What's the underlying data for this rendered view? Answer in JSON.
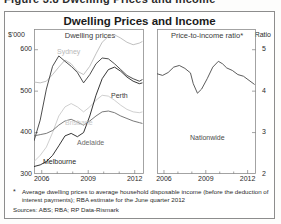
{
  "figure": {
    "cut_caption": "Figure 3.8   Dwelling Prices and Income",
    "title": "Dwelling Prices and Income"
  },
  "axes": {
    "left_unit": "$'000",
    "right_unit": "Ratio",
    "left_panel_label": "Dwelling prices",
    "right_panel_label": "Price-to-income ratio*",
    "left_yticks": [
      "600",
      "500",
      "400",
      "300"
    ],
    "right_yticks": [
      "5",
      "4",
      "3",
      "2"
    ],
    "xticks": [
      "2006",
      "2009",
      "2012"
    ]
  },
  "footnote": {
    "mark": "*",
    "text": "Average dwelling prices to average household disposable income (before the deduction of interest payments); RBA estimate for the June quarter 2012",
    "sources": "Sources: ABS; RBA; RP Data-Rismark"
  },
  "colors": {
    "sydney": "#b9b9b9",
    "perth": "#3a3a3a",
    "brisbane": "#c9c9c9",
    "adelaide": "#6a6a6a",
    "melbourne": "#1f1f1f",
    "nationwide": "#4a4a4a",
    "axis": "#8d8d8d"
  },
  "chart_data": [
    {
      "type": "line",
      "title": "Dwelling prices",
      "xlabel": "",
      "ylabel": "$'000",
      "xlim": [
        2005.5,
        2012.6
      ],
      "ylim": [
        300,
        650
      ],
      "yticks": [
        300,
        400,
        500,
        600
      ],
      "xticks": [
        2006,
        2009,
        2012
      ],
      "grid": false,
      "legend": "inline-labels",
      "series": [
        {
          "name": "Sydney",
          "color": "#b9b9b9",
          "x": [
            2005.5,
            2005.9,
            2006.3,
            2006.7,
            2007.1,
            2007.5,
            2007.9,
            2008.3,
            2008.7,
            2009.1,
            2009.5,
            2009.9,
            2010.3,
            2010.7,
            2011.1,
            2011.5,
            2011.9,
            2012.3,
            2012.5
          ],
          "values": [
            522,
            520,
            524,
            540,
            558,
            575,
            566,
            548,
            540,
            560,
            590,
            618,
            632,
            636,
            628,
            618,
            612,
            616,
            620
          ]
        },
        {
          "name": "Perth",
          "color": "#3a3a3a",
          "x": [
            2005.5,
            2005.9,
            2006.3,
            2006.7,
            2007.1,
            2007.5,
            2007.9,
            2008.3,
            2008.7,
            2009.1,
            2009.5,
            2009.9,
            2010.3,
            2010.7,
            2011.1,
            2011.5,
            2011.9,
            2012.3,
            2012.5
          ],
          "values": [
            380,
            430,
            505,
            560,
            585,
            572,
            560,
            545,
            520,
            540,
            566,
            580,
            578,
            566,
            552,
            538,
            530,
            524,
            528
          ]
        },
        {
          "name": "Brisbane",
          "color": "#c9c9c9",
          "x": [
            2005.5,
            2005.9,
            2006.3,
            2006.7,
            2007.1,
            2007.5,
            2007.9,
            2008.3,
            2008.7,
            2009.1,
            2009.5,
            2009.9,
            2010.3,
            2010.7,
            2011.1,
            2011.5,
            2011.9,
            2012.3,
            2012.5
          ],
          "values": [
            330,
            345,
            365,
            400,
            440,
            462,
            470,
            462,
            450,
            462,
            478,
            490,
            488,
            478,
            466,
            456,
            450,
            448,
            450
          ]
        },
        {
          "name": "Adelaide",
          "color": "#6a6a6a",
          "x": [
            2005.5,
            2005.9,
            2006.3,
            2006.7,
            2007.1,
            2007.5,
            2007.9,
            2008.3,
            2008.7,
            2009.1,
            2009.5,
            2009.9,
            2010.3,
            2010.7,
            2011.1,
            2011.5,
            2011.9,
            2012.3,
            2012.5
          ],
          "values": [
            392,
            395,
            398,
            405,
            418,
            428,
            432,
            425,
            418,
            428,
            440,
            450,
            452,
            448,
            440,
            434,
            428,
            424,
            422
          ]
        },
        {
          "name": "Melbourne",
          "color": "#1f1f1f",
          "x": [
            2005.5,
            2005.9,
            2006.3,
            2006.7,
            2007.1,
            2007.5,
            2007.9,
            2008.3,
            2008.7,
            2009.1,
            2009.5,
            2009.9,
            2010.3,
            2010.7,
            2011.1,
            2011.5,
            2011.9,
            2012.3,
            2012.5
          ],
          "values": [
            318,
            322,
            330,
            345,
            368,
            392,
            398,
            390,
            400,
            440,
            490,
            530,
            552,
            558,
            548,
            534,
            524,
            518,
            520
          ]
        }
      ]
    },
    {
      "type": "line",
      "title": "Price-to-income ratio*",
      "xlabel": "",
      "ylabel": "Ratio",
      "xlim": [
        2005.5,
        2012.6
      ],
      "ylim": [
        2,
        5.5
      ],
      "yticks": [
        2,
        3,
        4,
        5
      ],
      "xticks": [
        2006,
        2009,
        2012
      ],
      "grid": false,
      "series": [
        {
          "name": "Nationwide",
          "color": "#4a4a4a",
          "x": [
            2005.5,
            2005.9,
            2006.3,
            2006.7,
            2007.1,
            2007.5,
            2007.9,
            2008.1,
            2008.4,
            2008.7,
            2009.1,
            2009.5,
            2009.9,
            2010.2,
            2010.5,
            2010.9,
            2011.3,
            2011.7,
            2012.1,
            2012.5
          ],
          "values": [
            4.42,
            4.38,
            4.45,
            4.58,
            4.62,
            4.55,
            4.44,
            4.18,
            3.95,
            4.05,
            4.3,
            4.58,
            4.72,
            4.66,
            4.56,
            4.5,
            4.4,
            4.36,
            4.26,
            4.16
          ]
        }
      ]
    }
  ],
  "series_labels": {
    "sydney": "Sydney",
    "perth": "Perth",
    "brisbane": "Brisbane",
    "adelaide": "Adelaide",
    "melbourne": "Melbourne",
    "nationwide": "Nationwide"
  }
}
